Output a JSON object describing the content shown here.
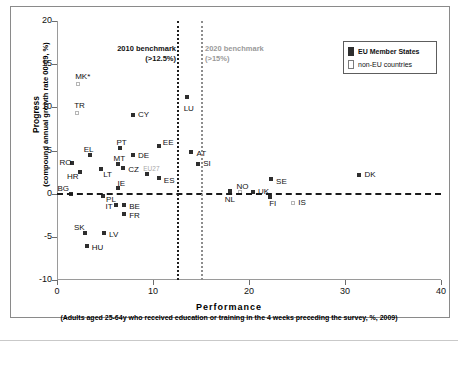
{
  "chart_data": {
    "type": "scatter",
    "title": "",
    "xlabel": "Performance",
    "xlabel_sub": "(Adults aged 25-64y who received education or training in the 4 weeks preceding the survey, %, 2009)",
    "ylabel": "Progress",
    "ylabel_sub": "(compound annual growth rate 00-09, %)",
    "xlim": [
      0,
      40
    ],
    "ylim": [
      -10,
      20
    ],
    "xticks": [
      0,
      10,
      20,
      30,
      40
    ],
    "yticks": [
      20,
      15,
      10,
      5,
      0,
      -5,
      -10
    ],
    "grid": false,
    "zero_reference_line": 0,
    "benchmarks": [
      {
        "name": "bench-2010",
        "label_line1": "2010 benchmark",
        "label_line2": "(>12.5%)",
        "x": 12.5,
        "color": "#1f1f1f"
      },
      {
        "name": "bench-2020",
        "label_line1": "2020 benchmark",
        "label_line2": "(>15%)",
        "x": 15,
        "color": "#8d8d8d"
      }
    ],
    "legend": {
      "position": "top-right",
      "entries": [
        {
          "label": "EU Member States",
          "style": "filled",
          "color": "#2e2e2e"
        },
        {
          "label": "non-EU countries",
          "style": "hollow",
          "color": "#ffffff"
        }
      ]
    },
    "series": [
      {
        "name": "EU Member States",
        "marker": "filled-square",
        "color": "#2e2e2e",
        "points": [
          {
            "label": "CY",
            "x": 7.8,
            "y": 9.1,
            "lx": 5,
            "ly": -4
          },
          {
            "label": "LU",
            "x": 13.4,
            "y": 11.2,
            "lx": -3,
            "ly": 8
          },
          {
            "label": "EE",
            "x": 10.5,
            "y": 5.5,
            "lx": 4,
            "ly": -7
          },
          {
            "label": "AT",
            "x": 13.9,
            "y": 4.8,
            "lx": 5,
            "ly": -2
          },
          {
            "label": "PT",
            "x": 6.5,
            "y": 5.3,
            "lx": -4,
            "ly": -9
          },
          {
            "label": "DE",
            "x": 7.8,
            "y": 4.5,
            "lx": 5,
            "ly": -3
          },
          {
            "label": "EL",
            "x": 3.3,
            "y": 4.5,
            "lx": -6,
            "ly": -9
          },
          {
            "label": "SI",
            "x": 14.6,
            "y": 3.4,
            "lx": 5,
            "ly": -4
          },
          {
            "label": "MT",
            "x": 6.2,
            "y": 3.4,
            "lx": -4,
            "ly": -9
          },
          {
            "label": "RO",
            "x": 1.5,
            "y": 3.6,
            "lx": -13,
            "ly": -4
          },
          {
            "label": "CZ",
            "x": 6.8,
            "y": 3.0,
            "lx": 5,
            "ly": -2
          },
          {
            "label": "LT",
            "x": 4.5,
            "y": 2.9,
            "lx": 2,
            "ly": 2
          },
          {
            "label": "HR",
            "x": 2.3,
            "y": 2.5,
            "lx": -13,
            "ly": 1
          },
          {
            "label": "EU27",
            "x": 9.3,
            "y": 2.3,
            "lx": -4,
            "ly": -9,
            "gray_label": true
          },
          {
            "label": "ES",
            "x": 10.5,
            "y": 1.8,
            "lx": 5,
            "ly": -1
          },
          {
            "label": "SE",
            "x": 22.2,
            "y": 1.7,
            "lx": 5,
            "ly": -1
          },
          {
            "label": "DK",
            "x": 31.4,
            "y": 2.2,
            "lx": 5,
            "ly": -4
          },
          {
            "label": "IE",
            "x": 6.3,
            "y": 0.6,
            "lx": -1,
            "ly": -8
          },
          {
            "label": "NL",
            "x": 17.9,
            "y": 0.3,
            "lx": -5,
            "ly": 5
          },
          {
            "label": "UK",
            "x": 20.3,
            "y": 0.2,
            "lx": 5,
            "ly": -4
          },
          {
            "label": "BG",
            "x": 1.4,
            "y": 0.0,
            "lx": -14,
            "ly": -9
          },
          {
            "label": "PL",
            "x": 4.7,
            "y": -0.3,
            "lx": 3,
            "ly": 0
          },
          {
            "label": "FI",
            "x": 22.1,
            "y": -0.4,
            "lx": -1,
            "ly": 3
          },
          {
            "label": "IT",
            "x": 6.0,
            "y": -1.3,
            "lx": -10,
            "ly": -2
          },
          {
            "label": "BE",
            "x": 6.9,
            "y": -1.3,
            "lx": 5,
            "ly": -2
          },
          {
            "label": "FR",
            "x": 6.9,
            "y": -2.3,
            "lx": 5,
            "ly": -2
          },
          {
            "label": "SK",
            "x": 2.8,
            "y": -4.6,
            "lx": -11,
            "ly": -9
          },
          {
            "label": "LV",
            "x": 4.8,
            "y": -4.6,
            "lx": 5,
            "ly": -2
          },
          {
            "label": "HU",
            "x": 3.0,
            "y": -6.1,
            "lx": 5,
            "ly": -2
          }
        ]
      },
      {
        "name": "non-EU countries",
        "marker": "hollow-square",
        "color": "#b6b6b6",
        "points": [
          {
            "label": "MK*",
            "x": 2.1,
            "y": 12.7,
            "lx": -3,
            "ly": -11
          },
          {
            "label": "TR",
            "x": 2.0,
            "y": 9.4,
            "lx": -3,
            "ly": -11
          },
          {
            "label": "NO",
            "x": 19.0,
            "y": 0.2,
            "lx": -4,
            "ly": -9
          },
          {
            "label": "IS",
            "x": 24.5,
            "y": -1.1,
            "lx": 5,
            "ly": -4
          }
        ]
      }
    ]
  }
}
